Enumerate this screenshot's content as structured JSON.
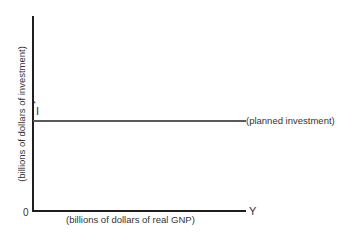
{
  "chart_data": {
    "type": "line",
    "title": "",
    "xlabel": "(billions of dollars of real GNP)",
    "ylabel": "(billions of dollars of investment)",
    "x_axis_end_label": "Y",
    "origin_label": "0",
    "grid": false,
    "legend": "none",
    "series": [
      {
        "name": "(planned investment)",
        "level_label": "I*",
        "description": "horizontal line at constant planned investment I* independent of Y",
        "x": [
          0,
          1
        ],
        "values": [
          0.54,
          0.54
        ]
      }
    ],
    "ylim": [
      0,
      1
    ],
    "xlim": [
      0,
      1
    ],
    "annotations": [
      {
        "text": "I*",
        "position": "y-axis at planned investment level"
      },
      {
        "text": "(planned investment)",
        "position": "right end of horizontal line"
      }
    ]
  },
  "labels": {
    "ylabel": "(billions of dollars of investment)",
    "xlabel": "(billions of dollars of real GNP)",
    "origin": "0",
    "x_end": "Y",
    "istar_base": "I",
    "istar_sup": "*",
    "line_label": "(planned investment)"
  }
}
